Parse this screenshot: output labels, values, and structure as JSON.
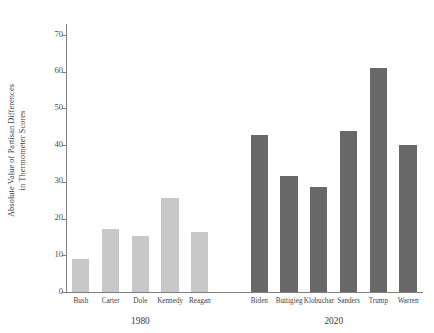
{
  "chart_data": {
    "type": "bar",
    "title": "",
    "xlabel": "",
    "ylabel_line1": "Absolute Value of Partisan Differences",
    "ylabel_line2": "in Thermometer Scores",
    "ylim": [
      0,
      73
    ],
    "yticks": [
      0,
      10,
      20,
      30,
      40,
      50,
      60,
      70
    ],
    "grid": false,
    "legend": "none",
    "groups": [
      {
        "name": "1980",
        "color": "#c8c8c8",
        "categories": [
          "Bush",
          "Carter",
          "Dole",
          "Kennedy",
          "Reagan"
        ],
        "values": [
          9.1,
          17.2,
          15.2,
          25.5,
          16.3
        ]
      },
      {
        "name": "2020",
        "color": "#686868",
        "categories": [
          "Biden",
          "Buttigieg",
          "Klobuchar",
          "Sanders",
          "Trump",
          "Warren"
        ],
        "values": [
          42.8,
          31.7,
          28.6,
          43.8,
          61.0,
          40.0
        ]
      }
    ],
    "categories": [
      "Bush",
      "Carter",
      "Dole",
      "Kennedy",
      "Reagan",
      "Biden",
      "Buttigieg",
      "Klobuchar",
      "Sanders",
      "Trump",
      "Warren"
    ],
    "values": [
      9.1,
      17.2,
      15.2,
      25.5,
      16.3,
      42.8,
      31.7,
      28.6,
      43.8,
      61.0,
      40.0
    ]
  },
  "axis": {
    "ytick_labels": [
      "0",
      "10",
      "20",
      "30",
      "40",
      "50",
      "60",
      "70"
    ]
  },
  "colors": {
    "era_1980": "#c8c8c8",
    "era_2020": "#686868",
    "axis": "#7f7f7f",
    "text": "#3a3a3a",
    "background": "#ffffff"
  }
}
